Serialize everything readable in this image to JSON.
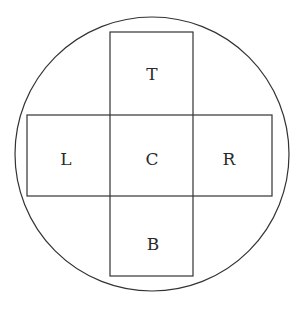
{
  "diagram": {
    "type": "cross-net-in-circle",
    "stroke_color": "#333333",
    "background": "#ffffff",
    "circle": {
      "cx": 152,
      "cy": 154,
      "r": 137
    },
    "vertical_rect": {
      "x": 110,
      "y": 32,
      "w": 83,
      "h": 244
    },
    "horizontal_rect": {
      "x": 27,
      "y": 115,
      "w": 245,
      "h": 81
    },
    "labels": {
      "top": "T",
      "left": "L",
      "center": "C",
      "right": "R",
      "bottom": "B"
    }
  }
}
